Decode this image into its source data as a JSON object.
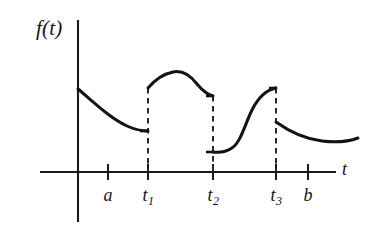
{
  "figure": {
    "title": "",
    "axis_labels": {
      "y": "f(t)",
      "x": "t"
    },
    "tick_labels": [
      {
        "text": "a",
        "sub": "",
        "x": 108
      },
      {
        "text": "t",
        "sub": "1",
        "x": 148
      },
      {
        "text": "t",
        "sub": "2",
        "x": 213
      },
      {
        "text": "t",
        "sub": "3",
        "x": 276
      },
      {
        "text": "b",
        "sub": "",
        "x": 308
      }
    ],
    "colors": {
      "curve": "#131313",
      "axis": "#1a1a1a",
      "dashed": "#2a2a2a",
      "background": "#ffffff"
    }
  },
  "chart_data": {
    "type": "line",
    "title": "",
    "xlabel": "t",
    "ylabel": "f(t)",
    "grid": false,
    "legend": null,
    "axes": {
      "origin_px": [
        78,
        172
      ],
      "x_axis_px": [
        40,
        336
      ],
      "y_axis_px": [
        20,
        222
      ],
      "xticks_px": [
        108,
        148,
        213,
        276,
        308
      ],
      "xtick_labels": [
        "a",
        "t₁",
        "t₂",
        "t₃",
        "b"
      ]
    },
    "breakpoints": [
      "t1",
      "t2",
      "t3"
    ],
    "segments": [
      {
        "name": "segment-1",
        "from": "0",
        "to": "t1",
        "shape": "decreasing convex, flattening toward t1",
        "path": "M 78 89 C 96 104, 110 118, 127 126 C 136 130, 143 131, 148 131"
      },
      {
        "name": "segment-2",
        "from": "t1",
        "to": "t2",
        "shape": "rises to a rounded peak then descends with a small step down at t2",
        "path": "M 148 88 C 154 81, 163 74, 173 72 C 182 70, 190 75, 197 84 C 203 91, 208 95, 213 96"
      },
      {
        "name": "segment-3",
        "from": "t2",
        "to": "t3",
        "shape": "flat low start then S-shaped sigmoid rise to a high plateau at t3",
        "path": "M 213 152 C 220 153, 226 152, 232 148 C 241 142, 245 124, 252 110 C 258 98, 266 90, 276 88"
      },
      {
        "name": "segment-4",
        "from": "t3",
        "to": "b+",
        "shape": "decreasing convex curve flattening to a shallow minimum then slightly rising",
        "path": "M 276 122 C 290 132, 305 139, 322 141 C 338 143, 350 141, 358 138"
      }
    ],
    "jump_discontinuities": [
      {
        "at": "t1",
        "x_px": 148,
        "y_from_px": 131,
        "y_to_px": 88
      },
      {
        "at": "t2",
        "x_px": 213,
        "y_from_px": 96,
        "y_to_px": 152
      },
      {
        "at": "t3",
        "x_px": 276,
        "y_from_px": 88,
        "y_to_px": 122
      }
    ],
    "dashed_verticals": [
      {
        "at": "t1",
        "x_px": 148,
        "y_top_px": 88,
        "y_bottom_px": 172
      },
      {
        "at": "t2",
        "x_px": 213,
        "y_top_px": 96,
        "y_bottom_px": 172
      },
      {
        "at": "t3",
        "x_px": 276,
        "y_top_px": 88,
        "y_bottom_px": 172
      }
    ]
  }
}
